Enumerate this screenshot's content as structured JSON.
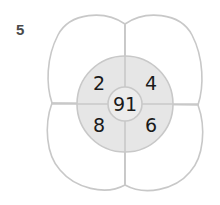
{
  "question": {
    "number": "5"
  },
  "diagram": {
    "type": "flower-number-wheel",
    "center_value": "91",
    "inner_ring": {
      "top_left": "2",
      "top_right": "4",
      "bottom_left": "8",
      "bottom_right": "6"
    },
    "outer_petals": {
      "top_left": "",
      "top_right": "",
      "bottom_left": "",
      "bottom_right": ""
    },
    "colors": {
      "stroke": "#c8c8c8",
      "ring_fill": "#e6e6e6",
      "petal_fill": "#ffffff",
      "text": "#1a1a1a",
      "label": "#4a4a4a"
    }
  }
}
